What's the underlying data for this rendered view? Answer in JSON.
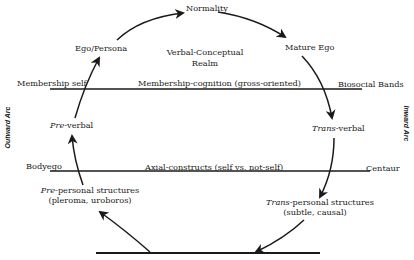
{
  "diagram": {
    "nodes": {
      "normality": "Normality",
      "ego_persona": "Ego/Persona",
      "mature_ego": "Mature Ego",
      "realm_line1": "Verbal-Conceptual",
      "realm_line2": "Realm",
      "pre_verbal_prefix": "Pre",
      "pre_verbal_suffix": "-verbal",
      "trans_verbal_prefix": "Trans",
      "trans_verbal_suffix": "-verbal",
      "pre_personal_prefix": "Pre",
      "pre_personal_suffix": "-personal structures",
      "pre_personal_sub": "(pleroma, uroboros)",
      "trans_personal_prefix": "Trans",
      "trans_personal_suffix": "-personal structures",
      "trans_personal_sub": "(subtle, causal)"
    },
    "lines": {
      "upper_left": "Membership self",
      "upper_center": "Membership-cognition (gross-oriented)",
      "upper_right": "Biosocial Bands",
      "lower_left": "Bodyego",
      "lower_center": "Axial-constructs (self vs. not-self)",
      "lower_right": "Centaur"
    },
    "side_labels": {
      "left": "Outward Arc",
      "right": "Inward Arc"
    }
  }
}
